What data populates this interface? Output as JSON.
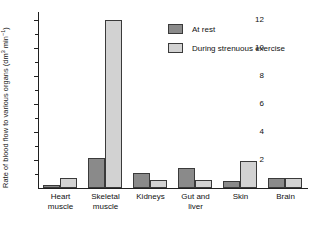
{
  "chart_data": {
    "type": "bar",
    "title": "",
    "xlabel": "",
    "ylabel": "Rate of blood flow to various organs (dm³ min⁻¹)",
    "ylabel_main": "Rate of blood flow to various organs (dm",
    "ylabel_sup1": "3",
    "ylabel_mid": " min",
    "ylabel_sup2": "−1",
    "ylabel_end": ")",
    "units": "dm3 min-1",
    "categories": [
      "Heart muscle",
      "Skeletal muscle",
      "Kidneys",
      "Gut and liver",
      "Skin",
      "Brain"
    ],
    "category_lines": [
      [
        "Heart",
        "muscle"
      ],
      [
        "Skeletal",
        "muscle"
      ],
      [
        "Kidneys",
        ""
      ],
      [
        "Gut and",
        "liver"
      ],
      [
        "Skin",
        ""
      ],
      [
        "Brain",
        ""
      ]
    ],
    "series": [
      {
        "name": "At rest",
        "color": "#8a8a8a",
        "values": [
          0.25,
          2.15,
          1.1,
          1.4,
          0.5,
          0.75
        ]
      },
      {
        "name": "During strenuous exercise",
        "color": "#d2d2d2",
        "values": [
          0.75,
          12.0,
          0.6,
          0.6,
          1.9,
          0.75
        ]
      }
    ],
    "ylim": [
      0,
      12.6
    ],
    "ytick_major": [
      2,
      4,
      6,
      8,
      10,
      12
    ],
    "ytick_minor": [
      1,
      3,
      5,
      7,
      9,
      11
    ],
    "ytick_labels": [
      "2",
      "4",
      "6",
      "8",
      "10",
      "12"
    ],
    "grid": false,
    "legend_position": "top-right"
  },
  "legend": {
    "items": [
      {
        "label": "At rest",
        "color": "#8a8a8a"
      },
      {
        "label": "During strenuous exercise",
        "color": "#d2d2d2"
      }
    ]
  }
}
